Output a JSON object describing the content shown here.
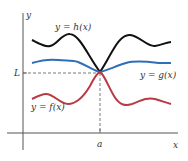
{
  "diagram": {
    "axes": {
      "x_label": "x",
      "y_label": "y",
      "point_a_label": "a",
      "limit_label": "L"
    },
    "curves": [
      {
        "name": "h",
        "label": "y = h(x)",
        "color": "#111111",
        "role": "upper bound"
      },
      {
        "name": "g",
        "label": "y = g(x)",
        "color": "#2f6fb8",
        "role": "middle function"
      },
      {
        "name": "f",
        "label": "y = f(x)",
        "color": "#b83a45",
        "role": "lower bound"
      }
    ],
    "guide_line_color": "#555555",
    "axis_color": "#555555"
  }
}
